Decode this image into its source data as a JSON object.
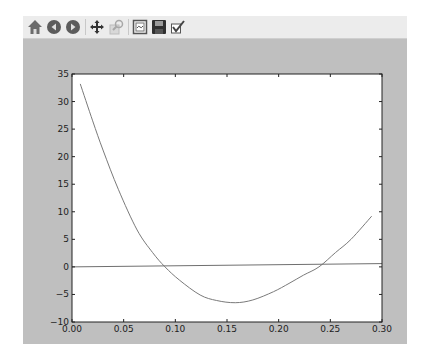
{
  "window": {
    "toolbar": [
      {
        "name": "home-icon",
        "label": "Home"
      },
      {
        "name": "back-icon",
        "label": "Back"
      },
      {
        "name": "forward-icon",
        "label": "Forward"
      },
      {
        "sep": true
      },
      {
        "name": "pan-icon",
        "label": "Pan"
      },
      {
        "name": "zoom-icon",
        "label": "Zoom",
        "disabled": true
      },
      {
        "sep": true
      },
      {
        "name": "configure-subplots-icon",
        "label": "Configure subplots"
      },
      {
        "name": "save-icon",
        "label": "Save"
      },
      {
        "name": "edit-icon",
        "label": "Edit parameters"
      }
    ]
  },
  "colors": {
    "figure_bg": "#bfbfbf",
    "axes_bg": "#ffffff",
    "line": "#7a7a7a",
    "toolbar_bg": "#ececec"
  },
  "chart_data": {
    "type": "line",
    "title": "",
    "xlabel": "",
    "ylabel": "",
    "xlim": [
      0.0,
      0.3
    ],
    "ylim": [
      -10,
      35
    ],
    "xticks": [
      "0.00",
      "0.05",
      "0.10",
      "0.15",
      "0.20",
      "0.25",
      "0.30"
    ],
    "yticks": [
      "−10",
      "−5",
      "0",
      "5",
      "10",
      "15",
      "20",
      "25",
      "30",
      "35"
    ],
    "grid": false,
    "legend": "none",
    "series": [
      {
        "name": "curve",
        "x": [
          0.008,
          0.02,
          0.03,
          0.045,
          0.063,
          0.078,
          0.09,
          0.104,
          0.124,
          0.14,
          0.158,
          0.175,
          0.195,
          0.21,
          0.224,
          0.239,
          0.255,
          0.27,
          0.29
        ],
        "y": [
          33.2,
          26.5,
          21.2,
          14.0,
          6.7,
          2.6,
          0.0,
          -2.4,
          -5.1,
          -6.1,
          -6.5,
          -6.0,
          -4.5,
          -3.0,
          -1.5,
          0.0,
          2.6,
          5.0,
          9.2
        ]
      },
      {
        "name": "horizontal-line",
        "x": [
          0.0,
          0.3
        ],
        "y": [
          0.0,
          0.6
        ]
      }
    ]
  }
}
